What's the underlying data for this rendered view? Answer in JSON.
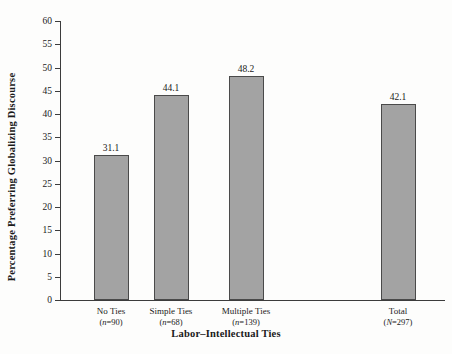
{
  "chart_data": {
    "type": "bar",
    "title": "",
    "xlabel": "Labor–Intellectual Ties",
    "ylabel": "Percentage Preferring Globalizing Discourse",
    "categories": [
      "No Ties",
      "Simple Ties",
      "Multiple Ties",
      "Total"
    ],
    "category_counts": [
      "(n=90)",
      "(n=68)",
      "(n=139)",
      "(N=297)"
    ],
    "count_symbols": [
      "n",
      "n",
      "n",
      "N"
    ],
    "count_values": [
      "=90)",
      "=68)",
      "=139)",
      "=297)"
    ],
    "values": [
      31.1,
      44.1,
      48.2,
      42.1
    ],
    "value_labels": [
      "31.1",
      "44.1",
      "48.2",
      "42.1"
    ],
    "ylim": [
      0,
      60
    ],
    "ytick_values": [
      0,
      5,
      10,
      15,
      20,
      25,
      30,
      35,
      40,
      45,
      50,
      55,
      60
    ],
    "ytick_labels": [
      "0",
      "5",
      "10",
      "15",
      "20",
      "25",
      "30",
      "35",
      "40",
      "45",
      "50",
      "55",
      "60"
    ],
    "grid": false,
    "legend": "none",
    "bar_color": "#a3a3a3",
    "bar_edge_color": "#4a4a4a",
    "axis_color": "#3c3c3c",
    "background": "#fdfdfc"
  }
}
